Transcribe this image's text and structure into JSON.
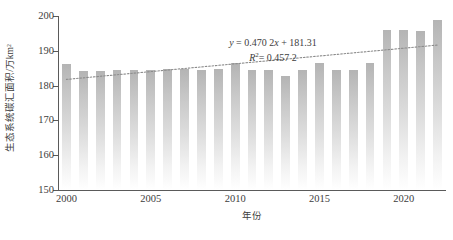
{
  "chart_data": {
    "type": "bar",
    "title": "",
    "subtitle": "",
    "xlabel": "年份",
    "ylabel": "生态系统碳汇面积/万km²",
    "ylim": [
      150,
      200
    ],
    "ytick_labels": [
      "150",
      "160",
      "170",
      "180",
      "190",
      "200"
    ],
    "ytick_values": [
      150,
      160,
      170,
      180,
      190,
      200
    ],
    "xlim": [
      1999.5,
      2022.5
    ],
    "xtick_labels": [
      "2000",
      "2005",
      "2010",
      "2015",
      "2020"
    ],
    "xtick_values": [
      2000,
      2005,
      2010,
      2015,
      2020
    ],
    "grid": false,
    "legend": "none",
    "bar_color": "#c0c0c0",
    "trendline_color": "#8c8c8c",
    "categories": [
      "2000",
      "2001",
      "2002",
      "2003",
      "2004",
      "2005",
      "2006",
      "2007",
      "2008",
      "2009",
      "2010",
      "2011",
      "2012",
      "2013",
      "2014",
      "2015",
      "2016",
      "2017",
      "2018",
      "2019",
      "2020",
      "2021",
      "2022"
    ],
    "values": [
      186.1,
      184.3,
      184.3,
      184.5,
      184.4,
      184.4,
      184.8,
      184.8,
      184.6,
      184.7,
      186.4,
      184.6,
      184.6,
      182.9,
      184.5,
      186.5,
      184.5,
      184.4,
      186.4,
      195.9,
      195.9,
      195.8,
      198.9
    ],
    "annotations": [
      {
        "id": "regression-equation",
        "text": "y = 0.470 2x + 181.31"
      },
      {
        "id": "r-squared",
        "text": "R² = 0.457 2"
      }
    ],
    "trendline": {
      "type": "linear",
      "slope": 0.4702,
      "intercept": 181.31,
      "r_squared": 0.4572,
      "style": "dotted",
      "y_start": 181.78,
      "y_end": 191.65
    }
  },
  "annotation_parts": {
    "eq_y": "y",
    "eq_rest": " = 0.470 2",
    "eq_x": "x",
    "eq_tail": " + 181.31",
    "r_symbol": "R",
    "r_exp": "2",
    "r_value": "= 0.457 2"
  }
}
